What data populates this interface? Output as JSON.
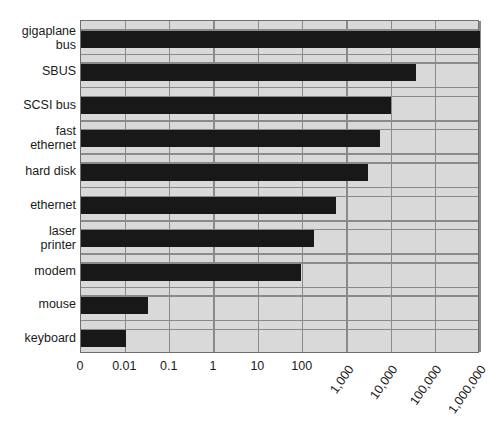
{
  "chart_data": {
    "type": "bar",
    "orientation": "horizontal",
    "title": "",
    "subtitle": "",
    "xlabel": "",
    "ylabel": "",
    "xscale": "log",
    "grid": true,
    "legend": null,
    "legend_position": "none",
    "background_color": "#d9d9d9",
    "bar_color": "#181818",
    "gridline_color": "#8a8a8a",
    "border_color": "#6f6f6f",
    "xticklabels": [
      "0",
      "0.01",
      "0.1",
      "1",
      "10",
      "100",
      "1,000",
      "10,000",
      "100,000",
      "1,000,000"
    ],
    "xtick_values": [
      0,
      0.01,
      0.1,
      1,
      10,
      100,
      1000,
      10000,
      100000,
      1000000
    ],
    "xtick_rotated": [
      false,
      false,
      false,
      false,
      false,
      false,
      true,
      true,
      true,
      true
    ],
    "xlim": [
      0,
      1000000
    ],
    "categories": [
      "gigaplane\nbus",
      "SBUS",
      "SCSI bus",
      "fast\nethernet",
      "hard disk",
      "ethernet",
      "laser\nprinter",
      "modem",
      "mouse",
      "keyboard"
    ],
    "values": [
      1000000,
      100000,
      30000,
      20000,
      7000,
      1000,
      200,
      100,
      0.03,
      0.01
    ],
    "value_labels": [
      "1,000,000",
      "100,000",
      "30,000",
      "20,000",
      "7,000",
      "1,000",
      "200",
      "100",
      "0.03",
      "0.01"
    ],
    "bar_lengths_px": [
      399,
      335,
      310,
      299,
      287,
      255,
      233,
      220,
      67,
      45
    ]
  }
}
